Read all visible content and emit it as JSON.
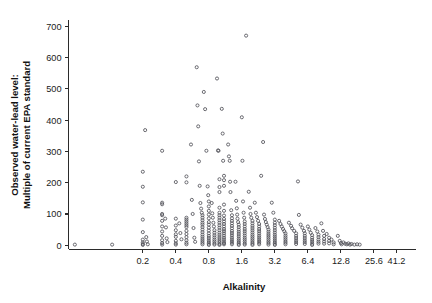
{
  "chart_data": {
    "type": "scatter",
    "title": "",
    "xlabel": "Alkalinity",
    "ylabel_line1": "Observed water-lead level:",
    "ylabel_line2": "Multiple of current EPA standard",
    "xscale": "log2",
    "yscale": "linear",
    "grid": false,
    "legend": null,
    "xticks": [
      0.2,
      0.4,
      0.8,
      1.6,
      3.2,
      6.4,
      12.8,
      25.6,
      41.2
    ],
    "xtick_labels": [
      "0.2",
      "0.4",
      "0.8",
      "1.6",
      "3.2",
      "6.4",
      "12.8",
      "25.6",
      "41.2"
    ],
    "yticks": [
      0,
      100,
      200,
      300,
      400,
      500,
      600,
      700
    ],
    "ytick_labels": [
      "0",
      "100",
      "200",
      "300",
      "400",
      "500",
      "600",
      "700"
    ],
    "xlim": [
      0.042,
      62.0
    ],
    "ylim": [
      -12,
      720
    ],
    "marker": "open-circle",
    "marker_size": 3.1,
    "marker_color": "#53535a",
    "axis_color": "#2b2b2b",
    "background": "#ffffff",
    "points": [
      [
        0.048,
        2
      ],
      [
        0.105,
        2
      ],
      [
        0.2,
        235
      ],
      [
        0.2,
        187
      ],
      [
        0.2,
        137
      ],
      [
        0.2,
        82
      ],
      [
        0.2,
        42
      ],
      [
        0.2,
        18
      ],
      [
        0.2,
        9
      ],
      [
        0.2,
        4
      ],
      [
        0.2,
        1
      ],
      [
        0.21,
        368
      ],
      [
        0.215,
        26
      ],
      [
        0.218,
        12
      ],
      [
        0.222,
        3
      ],
      [
        0.3,
        302
      ],
      [
        0.3,
        136
      ],
      [
        0.3,
        131
      ],
      [
        0.3,
        100
      ],
      [
        0.3,
        96
      ],
      [
        0.3,
        78
      ],
      [
        0.3,
        60
      ],
      [
        0.3,
        44
      ],
      [
        0.3,
        30
      ],
      [
        0.3,
        16
      ],
      [
        0.3,
        7
      ],
      [
        0.3,
        2
      ],
      [
        0.32,
        85
      ],
      [
        0.325,
        57
      ],
      [
        0.33,
        22
      ],
      [
        0.335,
        10
      ],
      [
        0.4,
        202
      ],
      [
        0.4,
        85
      ],
      [
        0.4,
        63
      ],
      [
        0.4,
        48
      ],
      [
        0.4,
        35
      ],
      [
        0.4,
        27
      ],
      [
        0.4,
        14
      ],
      [
        0.4,
        6
      ],
      [
        0.4,
        2
      ],
      [
        0.43,
        70
      ],
      [
        0.44,
        39
      ],
      [
        0.45,
        19
      ],
      [
        0.5,
        220
      ],
      [
        0.5,
        201
      ],
      [
        0.5,
        88
      ],
      [
        0.5,
        82
      ],
      [
        0.5,
        76
      ],
      [
        0.5,
        70
      ],
      [
        0.5,
        64
      ],
      [
        0.5,
        58
      ],
      [
        0.5,
        46
      ],
      [
        0.5,
        36
      ],
      [
        0.5,
        26
      ],
      [
        0.5,
        16
      ],
      [
        0.5,
        8
      ],
      [
        0.5,
        3
      ],
      [
        0.55,
        322
      ],
      [
        0.56,
        145
      ],
      [
        0.57,
        100
      ],
      [
        0.58,
        55
      ],
      [
        0.59,
        24
      ],
      [
        0.6,
        11
      ],
      [
        0.62,
        569
      ],
      [
        0.63,
        447
      ],
      [
        0.64,
        380
      ],
      [
        0.65,
        268
      ],
      [
        0.66,
        190
      ],
      [
        0.67,
        135
      ],
      [
        0.68,
        117
      ],
      [
        0.69,
        104
      ],
      [
        0.7,
        96
      ],
      [
        0.7,
        88
      ],
      [
        0.7,
        80
      ],
      [
        0.7,
        72
      ],
      [
        0.7,
        66
      ],
      [
        0.7,
        58
      ],
      [
        0.7,
        50
      ],
      [
        0.7,
        42
      ],
      [
        0.7,
        34
      ],
      [
        0.7,
        27
      ],
      [
        0.7,
        20
      ],
      [
        0.7,
        14
      ],
      [
        0.7,
        8
      ],
      [
        0.7,
        3
      ],
      [
        0.72,
        490
      ],
      [
        0.74,
        435
      ],
      [
        0.76,
        302
      ],
      [
        0.78,
        188
      ],
      [
        0.79,
        160
      ],
      [
        0.8,
        140
      ],
      [
        0.8,
        124
      ],
      [
        0.8,
        110
      ],
      [
        0.8,
        98
      ],
      [
        0.8,
        86
      ],
      [
        0.8,
        74
      ],
      [
        0.8,
        66
      ],
      [
        0.8,
        56
      ],
      [
        0.8,
        47
      ],
      [
        0.8,
        38
      ],
      [
        0.8,
        30
      ],
      [
        0.8,
        23
      ],
      [
        0.8,
        16
      ],
      [
        0.8,
        10
      ],
      [
        0.8,
        5
      ],
      [
        0.8,
        1
      ],
      [
        0.85,
        135
      ],
      [
        0.86,
        102
      ],
      [
        0.87,
        88
      ],
      [
        0.88,
        72
      ],
      [
        0.89,
        60
      ],
      [
        0.9,
        48
      ],
      [
        0.9,
        40
      ],
      [
        0.9,
        32
      ],
      [
        0.9,
        25
      ],
      [
        0.9,
        18
      ],
      [
        0.9,
        12
      ],
      [
        0.9,
        6
      ],
      [
        0.9,
        2
      ],
      [
        0.95,
        533
      ],
      [
        0.97,
        303
      ],
      [
        0.98,
        302
      ],
      [
        1.0,
        211
      ],
      [
        1.0,
        186
      ],
      [
        1.0,
        170
      ],
      [
        1.0,
        120
      ],
      [
        1.0,
        104
      ],
      [
        1.0,
        96
      ],
      [
        1.0,
        88
      ],
      [
        1.0,
        80
      ],
      [
        1.0,
        72
      ],
      [
        1.0,
        64
      ],
      [
        1.0,
        56
      ],
      [
        1.0,
        48
      ],
      [
        1.0,
        40
      ],
      [
        1.0,
        33
      ],
      [
        1.0,
        26
      ],
      [
        1.0,
        20
      ],
      [
        1.0,
        14
      ],
      [
        1.0,
        9
      ],
      [
        1.0,
        4
      ],
      [
        1.0,
        1
      ],
      [
        1.05,
        436
      ],
      [
        1.07,
        357
      ],
      [
        1.08,
        270
      ],
      [
        1.1,
        222
      ],
      [
        1.1,
        208
      ],
      [
        1.1,
        190
      ],
      [
        1.1,
        130
      ],
      [
        1.1,
        110
      ],
      [
        1.1,
        95
      ],
      [
        1.1,
        84
      ],
      [
        1.1,
        76
      ],
      [
        1.1,
        68
      ],
      [
        1.1,
        60
      ],
      [
        1.1,
        52
      ],
      [
        1.1,
        45
      ],
      [
        1.1,
        38
      ],
      [
        1.1,
        31
      ],
      [
        1.1,
        24
      ],
      [
        1.1,
        18
      ],
      [
        1.1,
        12
      ],
      [
        1.1,
        7
      ],
      [
        1.1,
        3
      ],
      [
        1.2,
        322
      ],
      [
        1.22,
        284
      ],
      [
        1.24,
        270
      ],
      [
        1.25,
        203
      ],
      [
        1.26,
        170
      ],
      [
        1.28,
        112
      ],
      [
        1.3,
        96
      ],
      [
        1.3,
        86
      ],
      [
        1.3,
        78
      ],
      [
        1.3,
        70
      ],
      [
        1.3,
        62
      ],
      [
        1.3,
        54
      ],
      [
        1.3,
        46
      ],
      [
        1.3,
        39
      ],
      [
        1.3,
        32
      ],
      [
        1.3,
        25
      ],
      [
        1.3,
        19
      ],
      [
        1.3,
        13
      ],
      [
        1.3,
        8
      ],
      [
        1.3,
        3
      ],
      [
        1.4,
        203
      ],
      [
        1.42,
        142
      ],
      [
        1.44,
        118
      ],
      [
        1.45,
        98
      ],
      [
        1.46,
        85
      ],
      [
        1.48,
        74
      ],
      [
        1.5,
        66
      ],
      [
        1.5,
        58
      ],
      [
        1.5,
        50
      ],
      [
        1.5,
        43
      ],
      [
        1.5,
        36
      ],
      [
        1.5,
        29
      ],
      [
        1.5,
        22
      ],
      [
        1.5,
        16
      ],
      [
        1.5,
        10
      ],
      [
        1.5,
        5
      ],
      [
        1.5,
        1
      ],
      [
        1.6,
        409
      ],
      [
        1.62,
        270
      ],
      [
        1.64,
        140
      ],
      [
        1.66,
        104
      ],
      [
        1.68,
        88
      ],
      [
        1.7,
        76
      ],
      [
        1.7,
        68
      ],
      [
        1.7,
        60
      ],
      [
        1.7,
        52
      ],
      [
        1.7,
        45
      ],
      [
        1.7,
        38
      ],
      [
        1.7,
        31
      ],
      [
        1.7,
        24
      ],
      [
        1.7,
        18
      ],
      [
        1.7,
        12
      ],
      [
        1.7,
        6
      ],
      [
        1.7,
        2
      ],
      [
        1.75,
        670
      ],
      [
        1.85,
        171
      ],
      [
        1.9,
        120
      ],
      [
        1.92,
        100
      ],
      [
        1.95,
        88
      ],
      [
        2.0,
        78
      ],
      [
        2.0,
        70
      ],
      [
        2.0,
        62
      ],
      [
        2.0,
        55
      ],
      [
        2.0,
        48
      ],
      [
        2.0,
        41
      ],
      [
        2.0,
        34
      ],
      [
        2.0,
        28
      ],
      [
        2.0,
        22
      ],
      [
        2.0,
        16
      ],
      [
        2.0,
        10
      ],
      [
        2.0,
        5
      ],
      [
        2.0,
        1
      ],
      [
        2.1,
        136
      ],
      [
        2.15,
        104
      ],
      [
        2.2,
        90
      ],
      [
        2.25,
        78
      ],
      [
        2.3,
        68
      ],
      [
        2.3,
        60
      ],
      [
        2.3,
        52
      ],
      [
        2.3,
        45
      ],
      [
        2.3,
        38
      ],
      [
        2.3,
        31
      ],
      [
        2.3,
        25
      ],
      [
        2.3,
        19
      ],
      [
        2.3,
        13
      ],
      [
        2.3,
        8
      ],
      [
        2.3,
        3
      ],
      [
        2.4,
        222
      ],
      [
        2.5,
        330
      ],
      [
        2.55,
        98
      ],
      [
        2.6,
        84
      ],
      [
        2.65,
        74
      ],
      [
        2.7,
        66
      ],
      [
        2.75,
        58
      ],
      [
        2.8,
        50
      ],
      [
        2.8,
        43
      ],
      [
        2.8,
        36
      ],
      [
        2.8,
        30
      ],
      [
        2.8,
        24
      ],
      [
        2.8,
        18
      ],
      [
        2.8,
        12
      ],
      [
        2.8,
        7
      ],
      [
        2.8,
        2
      ],
      [
        3.0,
        136
      ],
      [
        3.1,
        104
      ],
      [
        3.2,
        82
      ],
      [
        3.2,
        72
      ],
      [
        3.2,
        64
      ],
      [
        3.2,
        56
      ],
      [
        3.2,
        48
      ],
      [
        3.2,
        41
      ],
      [
        3.2,
        34
      ],
      [
        3.2,
        28
      ],
      [
        3.2,
        22
      ],
      [
        3.2,
        16
      ],
      [
        3.2,
        10
      ],
      [
        3.2,
        5
      ],
      [
        3.2,
        1
      ],
      [
        3.5,
        78
      ],
      [
        3.6,
        68
      ],
      [
        3.7,
        60
      ],
      [
        3.8,
        52
      ],
      [
        3.9,
        45
      ],
      [
        4.0,
        38
      ],
      [
        4.0,
        31
      ],
      [
        4.0,
        25
      ],
      [
        4.0,
        19
      ],
      [
        4.0,
        13
      ],
      [
        4.0,
        8
      ],
      [
        4.0,
        3
      ],
      [
        4.3,
        72
      ],
      [
        4.5,
        62
      ],
      [
        4.6,
        54
      ],
      [
        4.8,
        46
      ],
      [
        5.0,
        38
      ],
      [
        5.0,
        30
      ],
      [
        5.0,
        23
      ],
      [
        5.0,
        16
      ],
      [
        5.0,
        10
      ],
      [
        5.0,
        4
      ],
      [
        5.2,
        204
      ],
      [
        5.3,
        97
      ],
      [
        5.5,
        66
      ],
      [
        5.7,
        56
      ],
      [
        5.9,
        46
      ],
      [
        6.0,
        38
      ],
      [
        6.0,
        30
      ],
      [
        6.0,
        23
      ],
      [
        6.0,
        16
      ],
      [
        6.0,
        10
      ],
      [
        6.0,
        4
      ],
      [
        6.4,
        60
      ],
      [
        6.6,
        50
      ],
      [
        6.8,
        40
      ],
      [
        7.0,
        32
      ],
      [
        7.0,
        24
      ],
      [
        7.0,
        17
      ],
      [
        7.0,
        11
      ],
      [
        7.0,
        5
      ],
      [
        7.0,
        1
      ],
      [
        7.5,
        55
      ],
      [
        7.8,
        44
      ],
      [
        8.0,
        34
      ],
      [
        8.0,
        26
      ],
      [
        8.0,
        18
      ],
      [
        8.0,
        11
      ],
      [
        8.0,
        5
      ],
      [
        8.5,
        70
      ],
      [
        8.8,
        46
      ],
      [
        9.0,
        30
      ],
      [
        9.0,
        20
      ],
      [
        9.0,
        12
      ],
      [
        9.0,
        5
      ],
      [
        9.5,
        36
      ],
      [
        10.0,
        24
      ],
      [
        10.0,
        14
      ],
      [
        10.0,
        6
      ],
      [
        10.5,
        18
      ],
      [
        11.0,
        9
      ],
      [
        11.0,
        3
      ],
      [
        12.0,
        30
      ],
      [
        12.5,
        14
      ],
      [
        12.8,
        7
      ],
      [
        13.0,
        3
      ],
      [
        13.5,
        9
      ],
      [
        14.0,
        5
      ],
      [
        14.5,
        3
      ],
      [
        15.0,
        6
      ],
      [
        15.5,
        2
      ],
      [
        16.0,
        4
      ],
      [
        17.0,
        2
      ],
      [
        18.0,
        3
      ],
      [
        19.0,
        2
      ]
    ]
  },
  "axis_title_x": "Alkalinity",
  "axis_title_y": [
    "Observed water-lead level:",
    "Multiple of current EPA standard"
  ]
}
